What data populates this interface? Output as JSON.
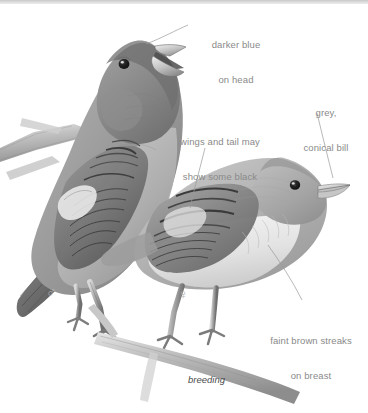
{
  "plate": {
    "kind": "field-guide-illustration",
    "subject": "two finches perched on branches",
    "medium": "graphite / greyscale drawing",
    "background_color": "#ffffff",
    "label_color": "#8a8a8a",
    "caption_color": "#4b4b4b",
    "leader_line_color": "#9a9a9a",
    "symbol_color": "#b4b4b4"
  },
  "annotations": [
    {
      "id": "darker-blue-on-head",
      "line1": "darker blue",
      "line2": "on head",
      "align": "center",
      "points_to": "male head crown"
    },
    {
      "id": "grey-conical-bill",
      "line1": "grey,",
      "line2": "conical bill",
      "align": "center",
      "points_to": "female bill"
    },
    {
      "id": "wings-and-tail-may-show-some-black",
      "line1": "wings and tail may",
      "line2": "show some black",
      "align": "center",
      "points_to": "female wing coverts"
    },
    {
      "id": "faint-brown-streaks-on-breast",
      "line1": "faint brown streaks",
      "line2": "on breast",
      "align": "center",
      "points_to": "female breast"
    }
  ],
  "caption": {
    "breeding": "breeding"
  },
  "symbols": {
    "male": "♂",
    "male_name": "male-symbol",
    "female": "♀",
    "female_name": "female-symbol"
  }
}
